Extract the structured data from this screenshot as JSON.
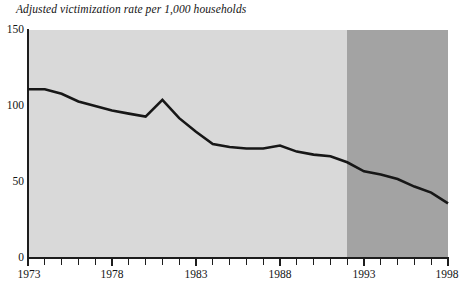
{
  "chart_data": {
    "type": "line",
    "title": "Adjusted victimization rate per 1,000 households",
    "xlabel": "",
    "ylabel": "",
    "xlim": [
      1973,
      1998
    ],
    "ylim": [
      0,
      150
    ],
    "yticks": [
      0,
      50,
      100,
      150
    ],
    "ytick_labels": [
      "0",
      "50",
      "100",
      "150"
    ],
    "xticks": [
      1973,
      1974,
      1975,
      1976,
      1977,
      1978,
      1979,
      1980,
      1981,
      1982,
      1983,
      1984,
      1985,
      1986,
      1987,
      1988,
      1989,
      1990,
      1991,
      1992,
      1993,
      1994,
      1995,
      1996,
      1997,
      1998
    ],
    "xtick_labels_shown": [
      "1973",
      "1978",
      "1983",
      "1988",
      "1993",
      "1998"
    ],
    "grid": false,
    "legend": "none",
    "x": [
      1973,
      1974,
      1975,
      1976,
      1977,
      1978,
      1979,
      1980,
      1981,
      1982,
      1983,
      1984,
      1985,
      1986,
      1987,
      1988,
      1989,
      1990,
      1991,
      1992,
      1993,
      1994,
      1995,
      1996,
      1997,
      1998
    ],
    "values": [
      111,
      111,
      108,
      103,
      100,
      97,
      95,
      93,
      104,
      92,
      83,
      75,
      73,
      72,
      72,
      74,
      70,
      68,
      67,
      63,
      57,
      55,
      52,
      47,
      43,
      36
    ],
    "series": [
      {
        "name": "Adjusted victimization rate per 1,000 households",
        "values": [
          111,
          111,
          108,
          103,
          100,
          97,
          95,
          93,
          104,
          92,
          83,
          75,
          73,
          72,
          72,
          74,
          70,
          68,
          67,
          63,
          57,
          55,
          52,
          47,
          43,
          36
        ]
      }
    ],
    "shaded_regions": [
      {
        "name": "pre-redesign-band",
        "from": 1973,
        "to": 1992,
        "color": "#d9d9d9"
      },
      {
        "name": "post-redesign-band",
        "from": 1992,
        "to": 1998,
        "color": "#a3a3a3"
      }
    ],
    "colors": {
      "line": "#171717",
      "axis": "#1d1d1d",
      "band_early": "#d9d9d9",
      "band_late": "#a3a3a3",
      "background": "#ffffff",
      "text": "#141414"
    }
  }
}
